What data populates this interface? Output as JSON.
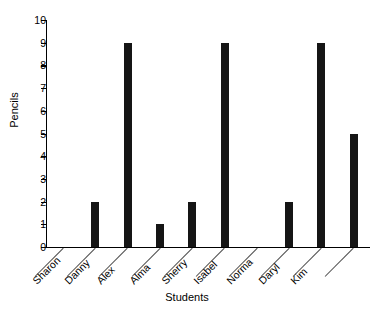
{
  "chart_data": {
    "type": "bar",
    "title": "",
    "xlabel": "Students",
    "ylabel": "Pencils",
    "categories": [
      "Sharon",
      "Danny",
      "Alex",
      "Alma",
      "Sherry",
      "Isabel",
      "Norma",
      "Daryl",
      "Kim"
    ],
    "values": [
      0,
      2,
      9,
      1,
      2,
      9,
      0,
      2,
      9
    ],
    "extra_bar_value": 5,
    "ylim": [
      0,
      10
    ],
    "ytick_labels": [
      "0",
      "1",
      "2",
      "3",
      "4",
      "5",
      "6",
      "7",
      "8",
      "9",
      "10"
    ],
    "ytick_values": [
      0,
      1,
      2,
      3,
      4,
      5,
      6,
      7,
      8,
      9,
      10
    ],
    "grid": false,
    "legend": false,
    "bar_color": "#151515",
    "axis_color": "#000000",
    "background": "#ffffff",
    "bars": [
      {
        "label": "Sharon",
        "value": 0
      },
      {
        "label": "Danny",
        "value": 2
      },
      {
        "label": "Alex",
        "value": 9
      },
      {
        "label": "Alma",
        "value": 1
      },
      {
        "label": "Sherry",
        "value": 2
      },
      {
        "label": "Isabel",
        "value": 9
      },
      {
        "label": "Norma",
        "value": 0
      },
      {
        "label": "Daryl",
        "value": 2
      },
      {
        "label": "Kim",
        "value": 9
      },
      {
        "label": "",
        "value": 5
      }
    ]
  }
}
